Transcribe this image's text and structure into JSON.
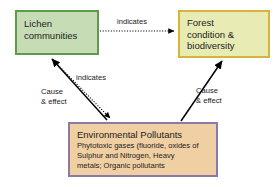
{
  "diagram": {
    "background_color": "#ffffff"
  },
  "nodes": {
    "lichen": {
      "id": "lichen-communities",
      "lines": [
        "Lichen",
        "communities"
      ],
      "fill_color": "#c6dcb4",
      "border_color": "#5d9c49"
    },
    "forest": {
      "id": "forest-condition-biodiversity",
      "lines": [
        "Forest",
        "condition &",
        "biodiversity"
      ],
      "fill_color": "#e8ecb4",
      "border_color": "#d8b33a"
    },
    "pollutants": {
      "id": "environmental-pollutants",
      "title": "Environmental Pollutants",
      "detail_lines": [
        "Phytotoxic gases (fluoride, oxides of",
        "Sulphur and Nitrogen, Heavy",
        "metals; Organic pollutants"
      ],
      "fill_color": "#f0cfa2",
      "border_color": "#8b7aa8"
    }
  },
  "edges": {
    "lichen_to_forest": {
      "label": "indicates",
      "style": "dotted",
      "from": "lichen",
      "to": "forest"
    },
    "pollutants_to_lichen": {
      "label": "Cause\n& effect",
      "label_line1": "Cause",
      "label_line2": "& effect",
      "style": "solid",
      "from": "pollutants",
      "to": "lichen"
    },
    "lichen_to_pollutants": {
      "label": "indicates",
      "style": "dotted",
      "from": "lichen",
      "to": "pollutants"
    },
    "pollutants_to_forest": {
      "label_line1": "Cause",
      "label_line2": "& effect",
      "style": "solid",
      "from": "pollutants",
      "to": "forest"
    }
  },
  "colors": {
    "arrow": "#000000",
    "text": "#222222"
  }
}
